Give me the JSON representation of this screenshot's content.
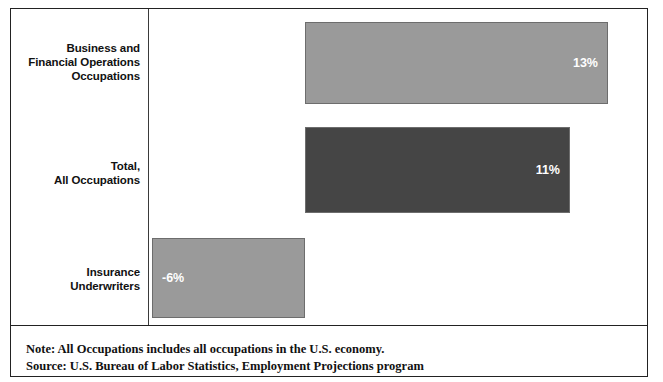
{
  "chart_data": {
    "type": "bar",
    "orientation": "horizontal",
    "title": "",
    "subtitle": "",
    "xlabel": "",
    "ylabel": "",
    "grid": false,
    "legend": null,
    "axis": {
      "zero_line": true,
      "tick_labels": [],
      "xlim": [
        -6,
        13
      ]
    },
    "categories": [
      "Business and Financial Operations Occupations",
      "Total, All Occupations",
      "Insurance Underwriters"
    ],
    "values": [
      13,
      11,
      -6
    ],
    "data_labels": [
      "13%",
      "11%",
      "-6%"
    ],
    "series": [
      {
        "name": "Percent change",
        "values": [
          13,
          11,
          -6
        ]
      }
    ],
    "bar_colors": [
      "#9a9a9a",
      "#454545",
      "#9a9a9a"
    ],
    "data_label_color": "#ffffff"
  },
  "chart": {
    "categories": [
      {
        "id": "business-financial-operations",
        "lines": [
          "Business and",
          "Financial Operations",
          "Occupations"
        ],
        "value_label": "13%",
        "value": 13
      },
      {
        "id": "total-all-occupations",
        "lines": [
          "Total,",
          "All Occupations"
        ],
        "value_label": "11%",
        "value": 11
      },
      {
        "id": "insurance-underwriters",
        "lines": [
          "Insurance",
          "Underwriters"
        ],
        "value_label": "-6%",
        "value": -6
      }
    ]
  },
  "notes": {
    "note": "Note: All Occupations includes all occupations in the U.S. economy.",
    "source": "Source: U.S. Bureau of Labor Statistics, Employment Projections program"
  },
  "colors": {
    "bar_light": "#9a9a9a",
    "bar_dark": "#454545",
    "frame": "#222222",
    "text": "#111111",
    "label_on_bar": "#ffffff",
    "background": "#ffffff"
  }
}
